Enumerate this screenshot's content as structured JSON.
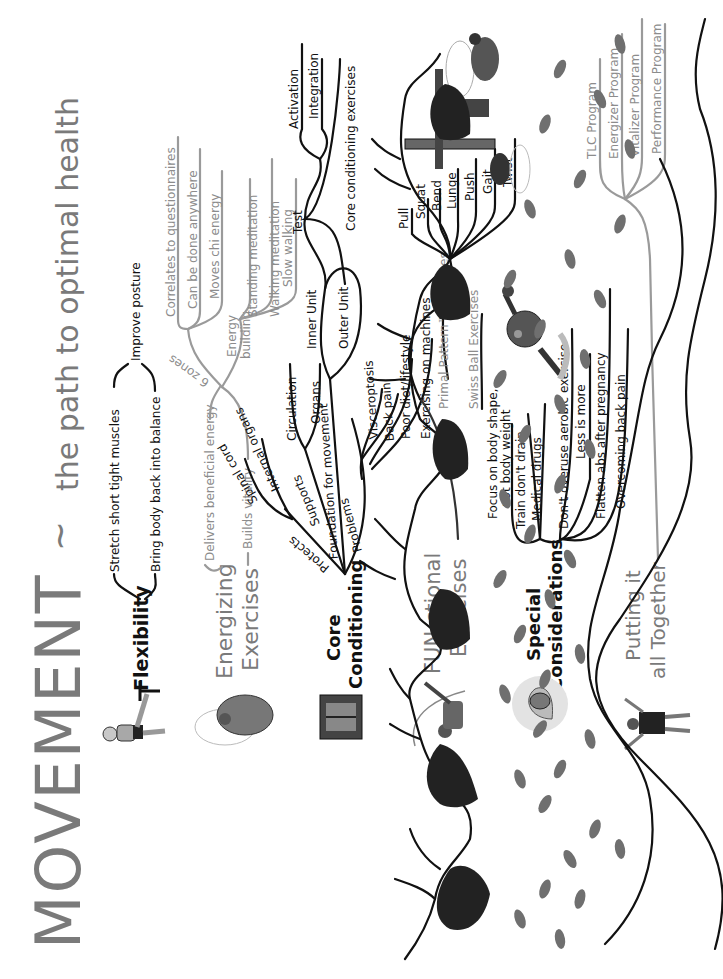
{
  "header": {
    "title": "MOVEMENT",
    "tilde": "~",
    "subtitle": "the path to optimal health"
  },
  "branches": [
    {
      "label": "Flexibility",
      "style": "dark",
      "children": [
        {
          "label": "Stretch short tight muscles"
        },
        {
          "label": "Bring body back into balance"
        },
        {
          "label": "Improve posture"
        }
      ]
    },
    {
      "label_line1": "Energizing",
      "label_line2": "Exercises",
      "style": "gray",
      "children": [
        {
          "label": "Delivers beneficial energy"
        },
        {
          "label": "Builds vitality"
        },
        {
          "label": "6 zones",
          "children": [
            {
              "label": "Correlates to questionnaires"
            },
            {
              "label": "Can be done anywhere"
            },
            {
              "label": "Moves chi energy"
            }
          ]
        },
        {
          "label_line1": "Energy",
          "label_line2": "building",
          "children": [
            {
              "label": "Standing meditation"
            },
            {
              "label": "Walking meditation"
            },
            {
              "label": "Slow walking"
            }
          ]
        }
      ]
    },
    {
      "label_line1": "Core",
      "label_line2": "Conditioning",
      "style": "dark",
      "children": [
        {
          "label": "Protects",
          "children": [
            {
              "label": "Spinal cord"
            },
            {
              "label": "Internal organs"
            }
          ]
        },
        {
          "label": "Supports",
          "children": [
            {
              "label": "Circulation"
            },
            {
              "label": "Organs"
            }
          ]
        },
        {
          "label": "Foundation for movement",
          "children": [
            {
              "label": "Inner Unit"
            },
            {
              "label": "Outer Unit"
            },
            {
              "label": "Test",
              "children": [
                {
                  "label": "Activation"
                },
                {
                  "label": "Integration"
                }
              ]
            },
            {
              "label": "Core conditioning exercises"
            }
          ]
        },
        {
          "label": "Problems",
          "children": [
            {
              "label": "Visceroptosis"
            },
            {
              "label": "Back pain"
            },
            {
              "label": "Poor diet/lifestyle"
            },
            {
              "label": "Exercising on machines"
            }
          ]
        }
      ]
    },
    {
      "label_line1": "FUN-ctional",
      "label_line2": "Exercises",
      "style": "gray",
      "children": [
        {
          "label": "Primal Pattern™ Exercises",
          "children": [
            {
              "label": "Pull"
            },
            {
              "label": "Squat"
            },
            {
              "label": "Bend"
            },
            {
              "label": "Lunge"
            },
            {
              "label": "Push"
            },
            {
              "label": "Gait"
            },
            {
              "label": "Twist"
            }
          ]
        },
        {
          "label": "Swiss Ball Exercises"
        }
      ]
    },
    {
      "label_line1": "Special",
      "label_line2": "Considerations",
      "style": "dark",
      "children": [
        {
          "label_line1": "Focus on body shape,",
          "label_line2": "not body weight"
        },
        {
          "label": "Train don't drain"
        },
        {
          "label": "Medical drugs"
        },
        {
          "label": "Don't overuse aerobic exercise"
        },
        {
          "label": "Less is more"
        },
        {
          "label": "Flatten abs after pregnancy"
        },
        {
          "label": "Overcoming back pain"
        }
      ]
    },
    {
      "label_line1": "Putting it",
      "label_line2": "all Together",
      "style": "gray",
      "children": [
        {
          "label": "TLC Program"
        },
        {
          "label": "Energizer Program"
        },
        {
          "label": "Vitalizer Program"
        },
        {
          "label": "Performance Program"
        }
      ]
    }
  ],
  "illustrations": [
    {
      "name": "leg-stretch-figure"
    },
    {
      "name": "energizing-exercise-figure"
    },
    {
      "name": "core-torso-figure"
    },
    {
      "name": "functional-cable-figure"
    },
    {
      "name": "pregnancy-figure"
    },
    {
      "name": "standing-figure"
    },
    {
      "name": "cable-machine-figure"
    },
    {
      "name": "lunge-figure"
    },
    {
      "name": "swiss-ball-figure"
    }
  ],
  "colors": {
    "dark_ink": "#111111",
    "gray_ink": "#8c8c8c",
    "title_gray": "#7a7a7a",
    "footprint": "#6f6f6f"
  }
}
